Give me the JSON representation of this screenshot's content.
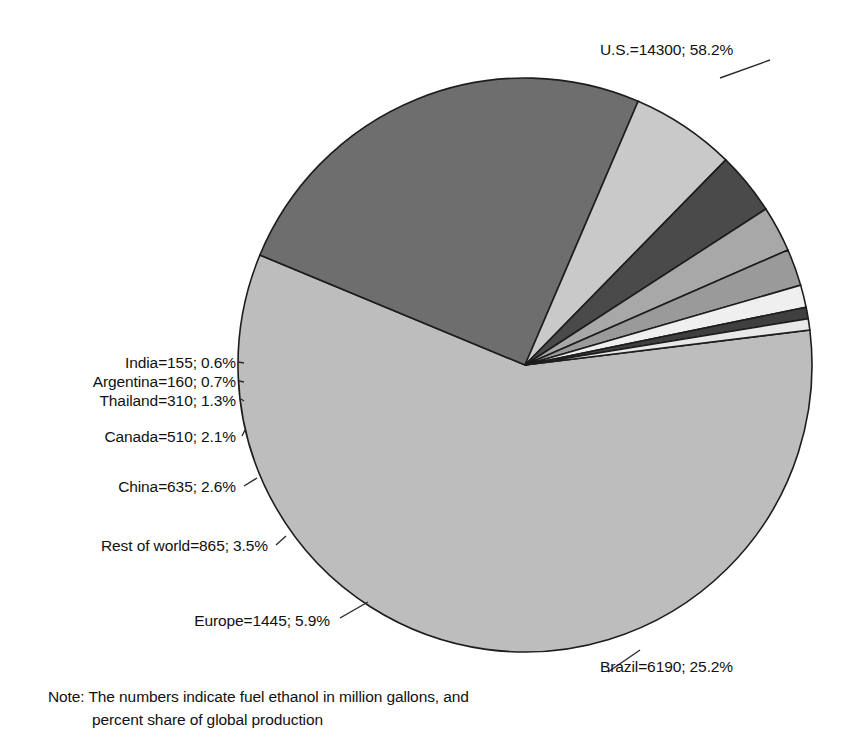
{
  "chart_data": {
    "type": "pie",
    "title": "",
    "unit": "million gallons",
    "total": 24570,
    "start_angle_deg": -7,
    "direction": "clockwise",
    "categories": [
      "U.S.",
      "Brazil",
      "Europe",
      "Rest of world",
      "China",
      "Canada",
      "Thailand",
      "Argentina",
      "India"
    ],
    "values": [
      14300,
      6190,
      1445,
      865,
      635,
      510,
      310,
      160,
      155
    ],
    "percents": [
      58.2,
      25.2,
      5.9,
      3.5,
      2.6,
      2.1,
      1.3,
      0.7,
      0.6
    ],
    "colors": [
      "#bdbdbd",
      "#6e6e6e",
      "#c9c9c9",
      "#4a4a4a",
      "#a8a8a8",
      "#9a9a9a",
      "#efefef",
      "#3f3f3f",
      "#e8e8e8"
    ],
    "labels": [
      "U.S.=14300; 58.2%",
      "Brazil=6190; 25.2%",
      "Europe=1445; 5.9%",
      "Rest of world=865; 3.5%",
      "China=635; 2.6%",
      "Canada=510; 2.1%",
      "Thailand=310; 1.3%",
      "Argentina=160; 0.7%",
      "India=155; 0.6%"
    ],
    "legend_position": "callout-labels",
    "grid": false,
    "note": "Note:  The numbers indicate fuel ethanol in million gallons, and percent share of global production"
  },
  "labels": {
    "us": "U.S.=14300; 58.2%",
    "brazil": "Brazil=6190; 25.2%",
    "europe": "Europe=1445; 5.9%",
    "rest_of_world": "Rest of world=865; 3.5%",
    "china": "China=635; 2.6%",
    "canada": "Canada=510; 2.1%",
    "thailand": "Thailand=310; 1.3%",
    "argentina": "Argentina=160; 0.7%",
    "india": "India=155; 0.6%"
  },
  "note": {
    "line1": "Note:  The numbers indicate fuel ethanol in million gallons, and",
    "line2": "percent share of global production"
  },
  "style": {
    "outline_color": "#1d1d1d",
    "background": "#ffffff"
  }
}
